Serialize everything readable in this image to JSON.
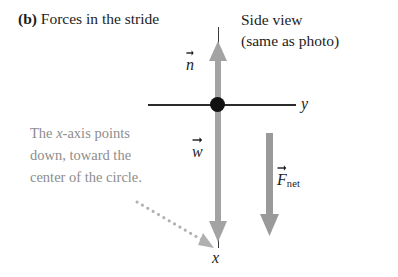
{
  "figure": {
    "panel_letter": "(b)",
    "panel_title": "Forces in the stride",
    "side_view_line1": "Side view",
    "side_view_line2": "(same as photo)",
    "note_line1_a": "The ",
    "note_line1_x": "x",
    "note_line1_b": "-axis points",
    "note_line2": "down, toward the",
    "note_line3": "center of the circle."
  },
  "axes": {
    "y_label": "y",
    "x_label": "x",
    "axis_color": "#2b2b2b",
    "origin_dot_color": "#111111"
  },
  "vectors": {
    "normal": {
      "symbol": "n",
      "direction": "up",
      "color": "#a3a3a3"
    },
    "weight": {
      "symbol": "w",
      "direction": "down",
      "color": "#a3a3a3"
    },
    "net_force": {
      "symbol": "F",
      "subscript": "net",
      "direction": "down",
      "color": "#9a9a9a"
    }
  },
  "annotation": {
    "pointer_style": "dotted-arrow",
    "pointer_color": "#b0b0b0",
    "note_text_color": "#8d8d8d"
  }
}
